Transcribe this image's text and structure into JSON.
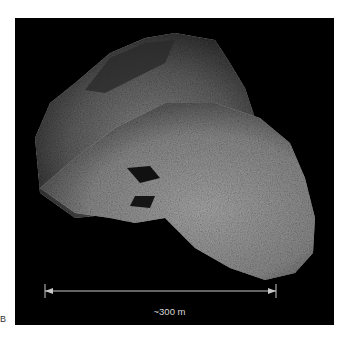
{
  "figure": {
    "panel_label": "B",
    "scale_bar": {
      "label": "~300 m",
      "color": "#cccccc"
    },
    "background_color": "#000000"
  }
}
